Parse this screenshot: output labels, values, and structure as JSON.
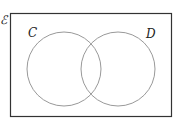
{
  "diagram": {
    "type": "venn",
    "universal_label": "ℰ",
    "sets": [
      {
        "label": "C"
      },
      {
        "label": "D"
      }
    ],
    "colors": {
      "border": "#333333",
      "circle": "#999999"
    }
  }
}
